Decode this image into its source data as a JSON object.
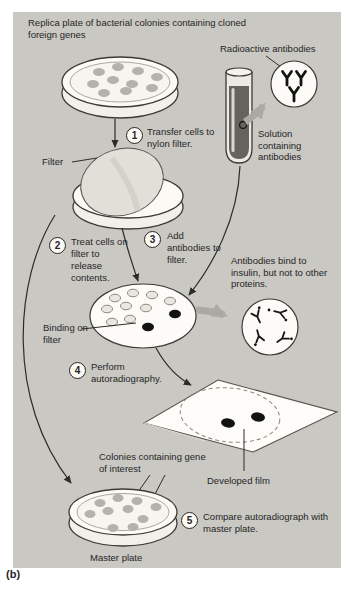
{
  "figure": {
    "panel_label": "(b)",
    "title": "Replica plate of bacterial colonies containing cloned foreign genes"
  },
  "labels": {
    "radioactive_antibodies": "Radioactive antibodies",
    "solution_containing_antibodies": "Solution containing antibodies",
    "filter": "Filter",
    "antibodies_bind": "Antibodies bind to insulin, but not to other proteins.",
    "binding_on_filter": "Binding on filter",
    "developed_film": "Developed film",
    "colonies_containing_gene": "Colonies containing gene of interest",
    "master_plate": "Master plate"
  },
  "steps": [
    {
      "num": "1",
      "text": "Transfer cells to nylon filter."
    },
    {
      "num": "2",
      "text": "Treat cells on filter to release contents."
    },
    {
      "num": "3",
      "text": "Add antibodies to filter."
    },
    {
      "num": "4",
      "text": "Perform autoradiography."
    },
    {
      "num": "5",
      "text": "Compare autoradiograph with master plate."
    }
  ],
  "colors": {
    "panel_bg": "#c9c8c3",
    "dish_fill": "#fbfaf5",
    "colony_gray": "#b3b2ab",
    "black_spot": "#121210",
    "gray_arrow": "#aaa9a2",
    "tube_solution": "#64635f",
    "filter_disc": "#e0dfd8",
    "line": "#2c2c28"
  }
}
